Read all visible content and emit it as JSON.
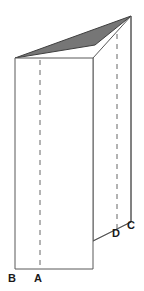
{
  "figure": {
    "background_color": "#ffffff",
    "outline_color": "#595959",
    "shade_color": "#767676",
    "shade_edge_color": "#3f3f3f",
    "fold_line_color": "#666666",
    "label_color": "#1a1a1a",
    "labels": [
      {
        "id": "A",
        "text": "A",
        "x": 38,
        "y": 278,
        "role": "fold-point-front"
      },
      {
        "id": "B",
        "text": "B",
        "x": 12,
        "y": 278,
        "role": "corner-front-left"
      },
      {
        "id": "C",
        "text": "C",
        "x": 131,
        "y": 225,
        "role": "corner-back-right"
      },
      {
        "id": "D",
        "text": "D",
        "x": 117,
        "y": 233,
        "role": "fold-point-back"
      }
    ],
    "geometry": {
      "front_panel": {
        "name": "front-rectangle",
        "points": "15,58 93,58 93,269 15,269",
        "fill": "#ffffff",
        "stroke": "#595959"
      },
      "back_panel": {
        "name": "back-panel",
        "points": "93,58 131,16 131,222 93,241",
        "fill": "#ffffff",
        "stroke": "#595959"
      },
      "shaded_triangle": {
        "name": "shaded-flap",
        "points": "15,58 131,16 95,45",
        "fill": "#767676",
        "stroke": "#3f3f3f"
      },
      "fold_lines": [
        {
          "name": "fold-line-front",
          "x1": 40,
          "y1": 60,
          "x2": 40,
          "y2": 267
        },
        {
          "name": "fold-line-back",
          "x1": 117,
          "y1": 36,
          "x2": 117,
          "y2": 233
        }
      ],
      "edges": [
        {
          "name": "edge-back-bottom",
          "x1": 93,
          "y1": 241,
          "x2": 131,
          "y2": 222
        },
        {
          "name": "edge-back-right",
          "x1": 131,
          "y1": 16,
          "x2": 131,
          "y2": 222
        },
        {
          "name": "edge-front-right",
          "x1": 93,
          "y1": 58,
          "x2": 93,
          "y2": 269
        }
      ]
    }
  }
}
